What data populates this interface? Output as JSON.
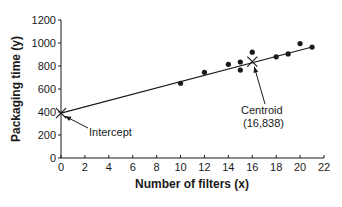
{
  "chart_data": {
    "type": "scatter",
    "title": "",
    "xlabel": "Number of filters (x)",
    "ylabel": "Packaging time (y)",
    "xlim": [
      0,
      22
    ],
    "ylim": [
      0,
      1200
    ],
    "x_ticks": [
      0,
      2,
      4,
      6,
      8,
      10,
      12,
      14,
      16,
      18,
      20,
      22
    ],
    "y_ticks": [
      0,
      200,
      400,
      600,
      800,
      1000,
      1200
    ],
    "grid": false,
    "legend": null,
    "series": [
      {
        "name": "observations",
        "marker": "dot",
        "points": [
          {
            "x": 10,
            "y": 650
          },
          {
            "x": 12,
            "y": 745
          },
          {
            "x": 14,
            "y": 815
          },
          {
            "x": 15,
            "y": 835
          },
          {
            "x": 15,
            "y": 765
          },
          {
            "x": 16,
            "y": 920
          },
          {
            "x": 18,
            "y": 880
          },
          {
            "x": 19,
            "y": 905
          },
          {
            "x": 20,
            "y": 995
          },
          {
            "x": 21,
            "y": 965
          }
        ]
      },
      {
        "name": "regression line",
        "type": "line",
        "points": [
          {
            "x": 0,
            "y": 390
          },
          {
            "x": 21,
            "y": 965
          }
        ]
      }
    ],
    "annotations": [
      {
        "label": "Intercept",
        "point": {
          "x": 0,
          "y": 390
        },
        "marker": "x"
      },
      {
        "label": "Centroid",
        "sublabel": "(16,838)",
        "point": {
          "x": 16,
          "y": 838
        },
        "marker": "x"
      }
    ]
  },
  "labels": {
    "xlabel": "Number of filters (x)",
    "ylabel": "Packaging time (y)",
    "intercept": "Intercept",
    "centroid": "Centroid",
    "centroid_coords": "(16,838)"
  },
  "colors": {
    "ink": "#1a1a1a",
    "background": "#ffffff"
  }
}
